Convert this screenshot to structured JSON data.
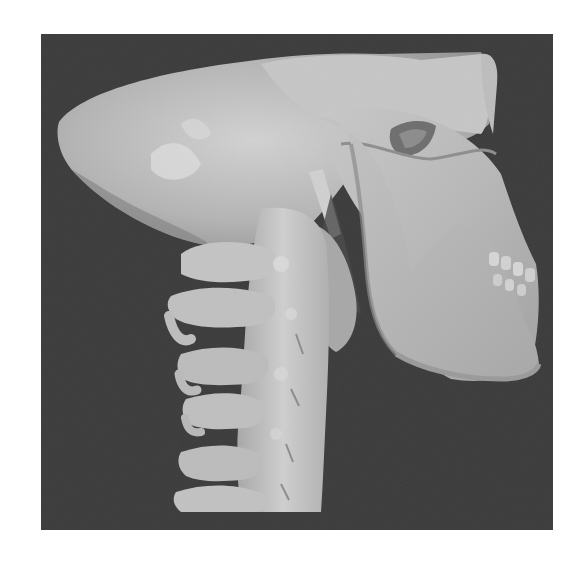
{
  "figure": {
    "description": "3D CT volume rendering, lateral view of skull and cervical spine",
    "background_color": "#3b3b3b",
    "bone_color_light": "#d4d4d4",
    "bone_color_mid": "#b0b0b0",
    "bone_color_dark": "#8a8a8a",
    "page_background": "#ffffff",
    "structures": [
      {
        "name": "cranium"
      },
      {
        "name": "orbit"
      },
      {
        "name": "maxilla"
      },
      {
        "name": "mandible"
      },
      {
        "name": "teeth"
      },
      {
        "name": "styloid-process"
      },
      {
        "name": "cervical-vertebrae",
        "count": 6
      }
    ]
  }
}
